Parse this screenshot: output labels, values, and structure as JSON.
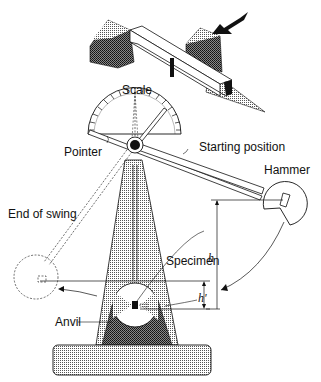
{
  "diagram": {
    "labels": {
      "scale": "Scale",
      "pointer": "Pointer",
      "starting_position": "Starting position",
      "hammer": "Hammer",
      "end_of_swing": "End of swing",
      "specimen": "Specimen",
      "anvil": "Anvil",
      "h": "h",
      "h_prime": "h'"
    },
    "parts": [
      "notched specimen inset with impact arrow",
      "scale dial",
      "pointer",
      "pendulum arm",
      "hammer",
      "tapered frame",
      "anvil",
      "base"
    ],
    "colors": {
      "line": "#111111",
      "fill_dark": "#333333",
      "fill_light": "#bbbbbb",
      "background": "#ffffff"
    }
  }
}
